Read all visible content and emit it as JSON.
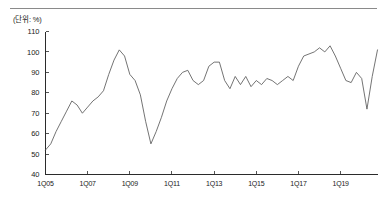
{
  "figure": {
    "unit_label": "(단위: %)",
    "top_rule_color": "#8a8a8a",
    "line_color": "#5b5b5b",
    "axis_color": "#2b2b2b",
    "background": "#ffffff"
  },
  "chart_data": {
    "type": "line",
    "title": "",
    "subtitle": "",
    "xlabel": "",
    "ylabel": "",
    "unit": "%",
    "unit_label": "(단위: %)",
    "grid": false,
    "legend": false,
    "legend_position": "none",
    "ylim": [
      40,
      110
    ],
    "yticks": [
      40,
      50,
      60,
      70,
      80,
      90,
      100,
      110
    ],
    "ytick_labels": [
      "40",
      "50",
      "60",
      "70",
      "80",
      "90",
      "100",
      "110"
    ],
    "xtick_labels": [
      "1Q05",
      "1Q07",
      "1Q09",
      "1Q11",
      "1Q13",
      "1Q15",
      "1Q17",
      "1Q19"
    ],
    "xtick_indices": [
      0,
      8,
      16,
      24,
      32,
      40,
      48,
      56
    ],
    "x": [
      "1Q05",
      "2Q05",
      "3Q05",
      "4Q05",
      "1Q06",
      "2Q06",
      "3Q06",
      "4Q06",
      "1Q07",
      "2Q07",
      "3Q07",
      "4Q07",
      "1Q08",
      "2Q08",
      "3Q08",
      "4Q08",
      "1Q09",
      "2Q09",
      "3Q09",
      "4Q09",
      "1Q10",
      "2Q10",
      "3Q10",
      "4Q10",
      "1Q11",
      "2Q11",
      "3Q11",
      "4Q11",
      "1Q12",
      "2Q12",
      "3Q12",
      "4Q12",
      "1Q13",
      "2Q13",
      "3Q13",
      "4Q13",
      "1Q14",
      "2Q14",
      "3Q14",
      "4Q14",
      "1Q15",
      "2Q15",
      "3Q15",
      "4Q15",
      "1Q16",
      "2Q16",
      "3Q16",
      "4Q16",
      "1Q17",
      "2Q17",
      "3Q17",
      "4Q17",
      "1Q18",
      "2Q18",
      "3Q18",
      "4Q18",
      "1Q19",
      "2Q19",
      "3Q19",
      "4Q19",
      "1Q20",
      "2Q20",
      "3Q20",
      "4Q20"
    ],
    "values": [
      52,
      55,
      61,
      66,
      71,
      76,
      74,
      70,
      73,
      76,
      78,
      81,
      89,
      96,
      101,
      98,
      89,
      86,
      79,
      66,
      55,
      61,
      68,
      76,
      82,
      87,
      90,
      91,
      86,
      84,
      86,
      93,
      95,
      95,
      86,
      82,
      88,
      84,
      88,
      83,
      86,
      84,
      87,
      86,
      84,
      86,
      88,
      86,
      93,
      98,
      99,
      100,
      102,
      100,
      103,
      98,
      92,
      86,
      85,
      90,
      87,
      72,
      88,
      101
    ],
    "series": [
      {
        "name": "",
        "values": [
          52,
          55,
          61,
          66,
          71,
          76,
          74,
          70,
          73,
          76,
          78,
          81,
          89,
          96,
          101,
          98,
          89,
          86,
          79,
          66,
          55,
          61,
          68,
          76,
          82,
          87,
          90,
          91,
          86,
          84,
          86,
          93,
          95,
          95,
          86,
          82,
          88,
          84,
          88,
          83,
          86,
          84,
          87,
          86,
          84,
          86,
          88,
          86,
          93,
          98,
          99,
          100,
          102,
          100,
          103,
          98,
          92,
          86,
          85,
          90,
          87,
          72,
          88,
          101
        ]
      }
    ]
  }
}
